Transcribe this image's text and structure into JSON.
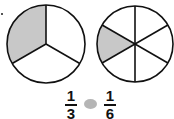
{
  "diagram": {
    "type": "fraction-comparison",
    "circles": [
      {
        "name": "thirds",
        "parts": 3,
        "shaded": 1,
        "label_num": "1",
        "label_den": "3"
      },
      {
        "name": "sixths",
        "parts": 6,
        "shaded": 1,
        "label_num": "1",
        "label_den": "6"
      }
    ],
    "comparison_symbol": "blank",
    "colors": {
      "shade": "#c8c8c8",
      "stroke": "#111111",
      "blank": "#b5b5b5"
    }
  }
}
